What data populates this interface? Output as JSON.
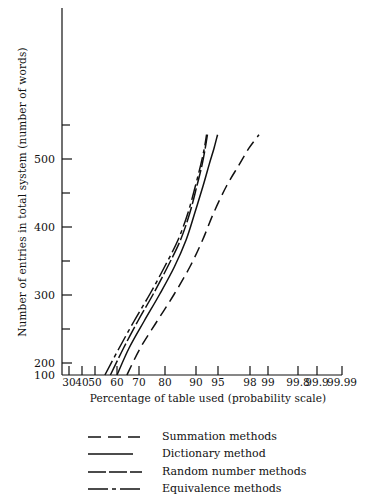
{
  "chart_data": {
    "type": "line",
    "title": "",
    "xlabel": "Percentage of table used (probability scale)",
    "ylabel": "Number of entries in total system (number of words)",
    "x_scale": "probability",
    "xtick_labels": [
      "30",
      "40",
      "50",
      "60",
      "70",
      "80",
      "90",
      "95",
      "98",
      "99",
      "99.8",
      "99.9",
      "99.99"
    ],
    "xtick_values": [
      30,
      40,
      50,
      60,
      70,
      80,
      90,
      95,
      98,
      99,
      99.8,
      99.9,
      99.99
    ],
    "ytick_labels": [
      "100",
      "200",
      "300",
      "400",
      "500"
    ],
    "ytick_values": [
      100,
      200,
      300,
      400,
      500
    ],
    "yminor_values": [
      150,
      250,
      350,
      450
    ],
    "ylim": [
      100,
      545
    ],
    "xlim": [
      30,
      99.99
    ],
    "grid": false,
    "legend_position": "below-axes",
    "series": [
      {
        "name": "Summation methods",
        "style": "dashed",
        "x": [
          64.5,
          70.5,
          77.0,
          83.0,
          88.0,
          91.5,
          94.0,
          95.8,
          97.0,
          97.9,
          98.5
        ],
        "y": [
          100,
          150,
          200,
          250,
          300,
          350,
          400,
          450,
          490,
          520,
          545
        ]
      },
      {
        "name": "Dictionary method",
        "style": "solid",
        "x": [
          60.0,
          65.5,
          72.0,
          78.0,
          83.0,
          86.8,
          89.6,
          91.6,
          93.0,
          94.1,
          94.9
        ],
        "y": [
          100,
          150,
          200,
          250,
          300,
          350,
          400,
          450,
          490,
          520,
          545
        ]
      },
      {
        "name": "Random number methods",
        "style": "long-dash",
        "x": [
          57.0,
          63.0,
          69.5,
          75.5,
          80.8,
          85.0,
          88.0,
          90.2,
          91.4,
          92.1,
          92.6
        ],
        "y": [
          100,
          150,
          200,
          250,
          300,
          350,
          400,
          450,
          490,
          520,
          545
        ]
      },
      {
        "name": "Equivalence methods",
        "style": "dash-dot",
        "x": [
          54.5,
          61.0,
          67.8,
          74.2,
          79.8,
          84.2,
          87.4,
          89.8,
          91.1,
          91.9,
          92.4
        ],
        "y": [
          100,
          150,
          200,
          250,
          300,
          350,
          400,
          450,
          490,
          520,
          545
        ]
      }
    ]
  },
  "axes": {
    "ylabel": "Number of entries in total system (number of words)",
    "xlabel": "Percentage of table used (probability scale)",
    "ytick_labels": [
      "500",
      "400",
      "300",
      "200",
      "100"
    ],
    "xtick_labels": [
      "30",
      "40",
      "50",
      "60",
      "70",
      "80",
      "90",
      "95",
      "98",
      "99",
      "99.8",
      "99.9",
      "99.99"
    ]
  },
  "legend": {
    "items": [
      {
        "label": "Summation methods",
        "style": "dashed"
      },
      {
        "label": "Dictionary method",
        "style": "solid"
      },
      {
        "label": "Random number methods",
        "style": "long-dash"
      },
      {
        "label": "Equivalence methods",
        "style": "dash-dot"
      }
    ]
  },
  "colors": {
    "ink": "#111111",
    "background": "#ffffff"
  }
}
